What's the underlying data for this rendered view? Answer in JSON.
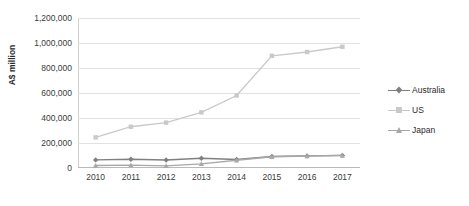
{
  "chart_data": {
    "type": "line",
    "title": "",
    "xlabel": "",
    "ylabel": "A$ million",
    "categories": [
      "2010",
      "2011",
      "2012",
      "2013",
      "2014",
      "2015",
      "2016",
      "2017"
    ],
    "ylim": [
      0,
      1200000
    ],
    "ytick_values": [
      0,
      200000,
      400000,
      600000,
      800000,
      1000000,
      1200000
    ],
    "ytick_labels": [
      "0",
      "200,000",
      "400,000",
      "600,000",
      "800,000",
      "1,000,000",
      "1,200,000"
    ],
    "grid": true,
    "legend_position": "right",
    "series": [
      {
        "name": "Australia",
        "color": "#808080",
        "marker": "diamond",
        "values": [
          65000,
          70000,
          64000,
          78000,
          68000,
          92000,
          97000,
          101000
        ]
      },
      {
        "name": "US",
        "color": "#c9c9c9",
        "marker": "square",
        "values": [
          245000,
          330000,
          363000,
          445000,
          580000,
          898000,
          928000,
          970000
        ]
      },
      {
        "name": "Japan",
        "color": "#a8a8a8",
        "marker": "triangle",
        "values": [
          20000,
          23000,
          17000,
          33000,
          62000,
          90000,
          96000,
          100000
        ]
      }
    ]
  },
  "colors": {
    "australia": "#808080",
    "us": "#c9c9c9",
    "japan": "#a8a8a8",
    "gridline": "#e2e2e2",
    "axis": "#b9b9b9",
    "text": "#3a3a3a",
    "background": "#ffffff"
  },
  "axis": {
    "y_title": "A$ million"
  },
  "legend": {
    "items": [
      {
        "label": "Australia"
      },
      {
        "label": "US"
      },
      {
        "label": "Japan"
      }
    ]
  }
}
